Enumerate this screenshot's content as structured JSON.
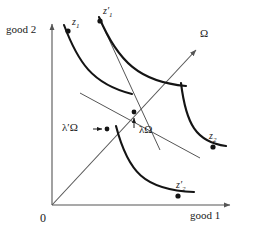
{
  "figure": {
    "name": "exchange-economy-indifference-curve-diagram",
    "background": "#ffffff",
    "ink": "#1a1a1a",
    "thin_ink": "#555555",
    "width": 258,
    "height": 235
  },
  "axes": {
    "x_label": "good 1",
    "y_label": "good 2",
    "origin_label": "0",
    "x_origin": 52,
    "y_origin": 205,
    "x_end": 232,
    "y_end": 22
  },
  "ray": {
    "label": "Ω",
    "from": [
      52,
      205
    ],
    "to": [
      198,
      48
    ],
    "tip_label_x": 200,
    "tip_label_y": 30
  },
  "points": [
    {
      "name": "z1",
      "label_html": "z<sub>1</sub>",
      "x": 68,
      "y": 31,
      "lx": 72,
      "ly": 22
    },
    {
      "name": "z1-prime",
      "label_html": "z′<sub>1</sub>",
      "x": 100,
      "y": 21,
      "lx": 104,
      "ly": 11
    },
    {
      "name": "z2",
      "label_html": "z<sub>2</sub>",
      "x": 213,
      "y": 147,
      "lx": 210,
      "ly": 134
    },
    {
      "name": "z2-prime",
      "label_html": "z′<sub>2</sub>",
      "x": 178,
      "y": 196,
      "lx": 177,
      "ly": 182
    }
  ],
  "ray_points": [
    {
      "name": "lambda-omega",
      "label": "λΩ",
      "x": 134,
      "y": 112,
      "label_x": 140,
      "label_y": 129,
      "arrow_from": [
        134,
        128
      ],
      "arrow_to": [
        134,
        117
      ]
    },
    {
      "name": "lambda-prime-omega",
      "label": "λ′Ω",
      "x": 107,
      "y": 129,
      "label_x": 76,
      "label_y": 122,
      "arrow_from": [
        94,
        129
      ],
      "arrow_to": [
        103,
        129
      ]
    }
  ],
  "curves": [
    {
      "name": "indifference-curve-z1",
      "d": "M 64 25 C 78 62, 92 84, 132 94"
    },
    {
      "name": "indifference-curve-z1-prime",
      "d": "M 99 17 C 118 62, 140 82, 186 86"
    },
    {
      "name": "indifference-curve-z2",
      "d": "M 181 83 C 186 124, 196 142, 226 146"
    },
    {
      "name": "indifference-curve-z2-prime",
      "d": "M 116 126 C 128 172, 144 190, 194 192"
    }
  ],
  "budget_lines": [
    {
      "name": "price-line-steep",
      "d": "M 101 22 L 160 150"
    },
    {
      "name": "price-line-flat",
      "d": "M 80 93 L 200 158"
    }
  ],
  "caption": {
    "title": "Exchange economy: indifference curves, endowment ray Ω, and price lines"
  }
}
